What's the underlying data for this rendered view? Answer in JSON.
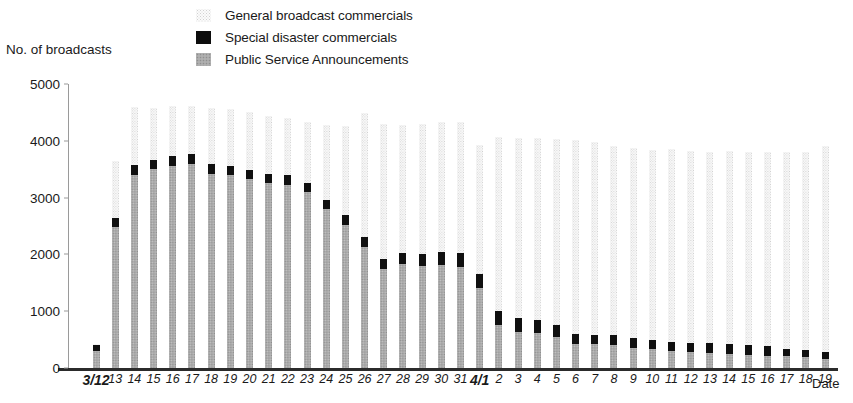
{
  "legend": {
    "items": [
      {
        "label": "General broadcast commercials",
        "swatch": "general-swatch",
        "color": "#f7f7f7"
      },
      {
        "label": "Special disaster commercials",
        "swatch": "special-swatch",
        "color": "#101010"
      },
      {
        "label": "Public Service Announcements",
        "swatch": "psa-swatch",
        "color": "#ababab"
      }
    ]
  },
  "axes": {
    "y_title": "No. of broadcasts",
    "x_title": "Date",
    "y_ticks": [
      "0",
      "1000",
      "2000",
      "3000",
      "4000",
      "5000"
    ]
  },
  "chart_data": {
    "type": "bar",
    "title": "",
    "subtitle": "",
    "xlabel": "Date",
    "ylabel": "No. of broadcasts",
    "ylim": [
      0,
      5000
    ],
    "yticks": [
      0,
      1000,
      2000,
      3000,
      4000,
      5000
    ],
    "grid": false,
    "stacked": true,
    "legend_position": "top-center",
    "categories": [
      "3/12",
      "13",
      "14",
      "15",
      "16",
      "17",
      "18",
      "19",
      "20",
      "21",
      "22",
      "23",
      "24",
      "25",
      "26",
      "27",
      "28",
      "29",
      "30",
      "31",
      "4/1",
      "2",
      "3",
      "4",
      "5",
      "6",
      "7",
      "8",
      "9",
      "10",
      "11",
      "12",
      "13",
      "14",
      "15",
      "16",
      "17",
      "18",
      "19"
    ],
    "series": [
      {
        "name": "Public Service Announcements",
        "color": "#ababab",
        "values": [
          300,
          2480,
          3400,
          3500,
          3560,
          3600,
          3420,
          3400,
          3320,
          3250,
          3230,
          3100,
          2800,
          2520,
          2130,
          1750,
          1830,
          1800,
          1810,
          1780,
          1400,
          760,
          640,
          620,
          540,
          430,
          420,
          400,
          360,
          330,
          300,
          280,
          270,
          250,
          230,
          220,
          210,
          190,
          160
        ]
      },
      {
        "name": "Special disaster commercials",
        "color": "#101010",
        "values": [
          110,
          170,
          170,
          170,
          175,
          175,
          175,
          165,
          165,
          165,
          160,
          160,
          165,
          175,
          185,
          175,
          190,
          215,
          230,
          240,
          250,
          240,
          235,
          225,
          220,
          170,
          165,
          175,
          175,
          170,
          165,
          165,
          165,
          170,
          170,
          165,
          130,
          125,
          130
        ]
      },
      {
        "name": "General broadcast commercials",
        "color": "#f7f7f7",
        "values": [
          20,
          1000,
          1020,
          900,
          880,
          840,
          980,
          1000,
          1030,
          1030,
          1020,
          1070,
          1310,
          1560,
          2170,
          2380,
          2250,
          2290,
          2290,
          2310,
          2270,
          3060,
          3180,
          3210,
          3270,
          3420,
          3390,
          3340,
          3330,
          3340,
          3390,
          3370,
          3360,
          3400,
          3400,
          3420,
          3470,
          3490,
          3620
        ]
      }
    ],
    "totals": [
      430,
      3650,
      4590,
      4570,
      4615,
      4615,
      4575,
      4565,
      4515,
      4445,
      4410,
      4330,
      4275,
      4255,
      4485,
      4305,
      4270,
      4305,
      4330,
      4330,
      3920,
      4060,
      4055,
      4055,
      4030,
      4020,
      3975,
      3915,
      3865,
      3840,
      3855,
      3815,
      3795,
      3820,
      3800,
      3805,
      3810,
      3805,
      3910
    ]
  }
}
